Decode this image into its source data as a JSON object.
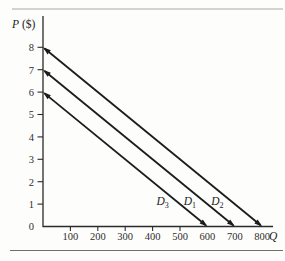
{
  "chart_data": {
    "type": "line",
    "title": "",
    "xlabel": "Q",
    "ylabel": "P ($)",
    "ylabel_symbol": "P",
    "ylabel_unit": "($)",
    "xlabel_symbol": "Q",
    "xlim": [
      0,
      800
    ],
    "ylim": [
      0,
      8
    ],
    "x_ticks": [
      100,
      200,
      300,
      400,
      500,
      600,
      700,
      800
    ],
    "y_ticks": [
      0,
      1,
      2,
      3,
      4,
      5,
      6,
      7,
      8
    ],
    "grid": false,
    "legend": "inline-labels",
    "series": [
      {
        "label": "D",
        "subscript": "3",
        "x": [
          0,
          600
        ],
        "y": [
          6,
          0
        ],
        "arrows": "both"
      },
      {
        "label": "D",
        "subscript": "1",
        "x": [
          0,
          700
        ],
        "y": [
          7,
          0
        ],
        "arrows": "both"
      },
      {
        "label": "D",
        "subscript": "2",
        "x": [
          0,
          800
        ],
        "y": [
          8,
          0
        ],
        "arrows": "both"
      }
    ],
    "colors": {
      "line": "#1c1c1c",
      "axis": "#2b2b2b",
      "tick_text": "#2e2e2e",
      "rule_top": "#a8a8a8",
      "rule_bottom": "#6f6f6f",
      "background": "#fdfdfc"
    }
  }
}
